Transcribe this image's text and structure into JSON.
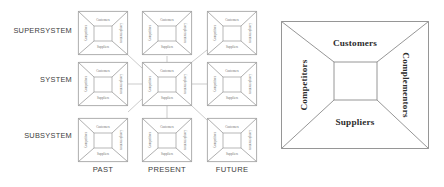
{
  "diagram": {
    "row_labels": [
      {
        "id": "supersystem",
        "text": "SUPERSYSTEM",
        "y": 31
      },
      {
        "id": "system",
        "text": "SYSTEM",
        "y": 80
      },
      {
        "id": "subsystem",
        "text": "SUBSYSTEM",
        "y": 131
      }
    ],
    "col_labels": [
      {
        "id": "past",
        "text": "PAST",
        "x": 103
      },
      {
        "id": "present",
        "text": "PRESENT",
        "x": 167
      },
      {
        "id": "future",
        "text": "FUTURE",
        "x": 232
      }
    ],
    "grid": {
      "rows": 3,
      "cols": 3,
      "col_x": [
        78,
        142,
        207
      ],
      "row_y": [
        11,
        62,
        118
      ],
      "cell_width": 50,
      "cell_height": 44,
      "cells": [
        {
          "row": "supersystem",
          "col": "past"
        },
        {
          "row": "supersystem",
          "col": "present"
        },
        {
          "row": "supersystem",
          "col": "future"
        },
        {
          "row": "system",
          "col": "past"
        },
        {
          "row": "system",
          "col": "present"
        },
        {
          "row": "system",
          "col": "future"
        },
        {
          "row": "subsystem",
          "col": "past"
        },
        {
          "row": "subsystem",
          "col": "present"
        },
        {
          "row": "subsystem",
          "col": "future"
        }
      ]
    },
    "value_net": {
      "top": "Customers",
      "bottom": "Suppliers",
      "left": "Competitors",
      "right": "Complementors"
    },
    "colors": {
      "line": "#8d8d8d",
      "link": "#a8a8a8",
      "label_text": "#3d3d3d",
      "mini_text": "#6e6e6e",
      "big_text": "#2b2b2b",
      "background": "#ffffff"
    }
  }
}
